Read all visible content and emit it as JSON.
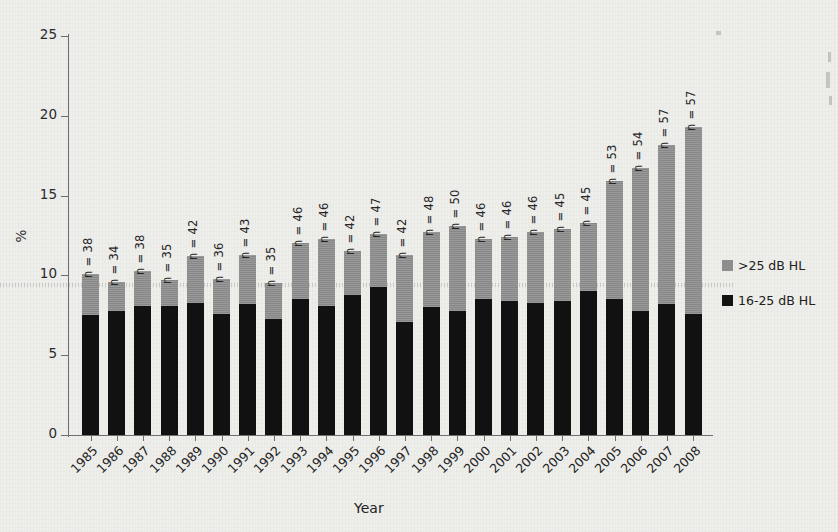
{
  "chart_data": {
    "type": "bar",
    "stacked": true,
    "title": "",
    "xlabel": "Year",
    "ylabel": "%",
    "ylim": [
      0,
      25
    ],
    "yticks": [
      0,
      5,
      10,
      15,
      20,
      25
    ],
    "grid": false,
    "legend_position": "right",
    "categories": [
      "1985",
      "1986",
      "1987",
      "1988",
      "1989",
      "1990",
      "1991",
      "1992",
      "1993",
      "1994",
      "1995",
      "1996",
      "1997",
      "1998",
      "1999",
      "2000",
      "2001",
      "2002",
      "2003",
      "2004",
      "2005",
      "2006",
      "2007",
      "2008"
    ],
    "series": [
      {
        "name": "16-25 dB HL",
        "color": "#111111",
        "values": [
          7.5,
          7.8,
          8.1,
          8.1,
          8.3,
          7.6,
          8.2,
          7.3,
          8.5,
          8.1,
          8.8,
          9.3,
          7.1,
          8.0,
          7.8,
          8.5,
          8.4,
          8.3,
          8.4,
          9.0,
          8.5,
          7.8,
          8.2,
          7.6
        ]
      },
      {
        "name": ">25 dB HL",
        "color": "#8e8e8e",
        "values": [
          2.6,
          1.8,
          2.2,
          1.6,
          2.9,
          2.2,
          3.1,
          2.2,
          3.5,
          4.2,
          2.7,
          3.3,
          4.2,
          4.7,
          5.3,
          3.8,
          4.0,
          4.4,
          4.5,
          4.3,
          7.4,
          8.9,
          10.0,
          11.7
        ]
      }
    ],
    "totals": [
      10.1,
      9.6,
      10.3,
      9.7,
      11.2,
      9.8,
      11.3,
      9.5,
      12.0,
      12.3,
      11.5,
      12.6,
      11.3,
      12.7,
      13.1,
      12.3,
      12.4,
      12.7,
      12.9,
      13.3,
      15.9,
      16.7,
      18.2,
      19.3
    ],
    "annotations": [
      "n = 38",
      "n = 34",
      "n = 38",
      "n = 35",
      "n = 42",
      "n = 36",
      "n = 43",
      "n = 35",
      "n = 46",
      "n = 46",
      "n = 42",
      "n = 47",
      "n = 42",
      "n = 48",
      "n = 50",
      "n = 46",
      "n = 46",
      "n = 46",
      "n = 45",
      "n = 45",
      "n = 53",
      "n = 54",
      "n = 57",
      "n = 57"
    ]
  },
  "legend": {
    "items": [
      {
        "label": ">25 dB HL",
        "color": "#8e8e8e"
      },
      {
        "label": "16-25 dB HL",
        "color": "#121212"
      }
    ]
  },
  "axes": {
    "y_title": "%",
    "x_title": "Year",
    "y_tick_labels": [
      "25",
      "20",
      "15",
      "10",
      "5",
      "0"
    ]
  }
}
